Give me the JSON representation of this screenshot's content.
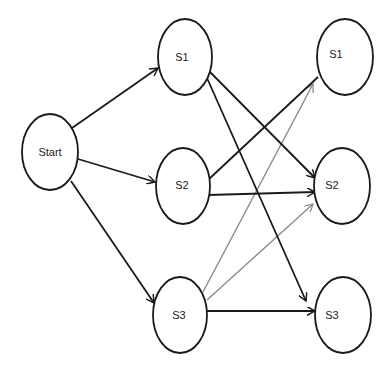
{
  "diagram": {
    "type": "state-transition-graph",
    "colors": {
      "node_stroke": "#1a1a1a",
      "edge_primary": "#1a1a1a",
      "edge_secondary": "#8a8a8a",
      "background": "#ffffff"
    },
    "nodes": [
      {
        "id": "start",
        "label": "Start",
        "cx": 50,
        "cy": 152,
        "rx": 28,
        "ry": 38
      },
      {
        "id": "s1_left",
        "label": "S1",
        "cx": 185,
        "cy": 57,
        "rx": 27,
        "ry": 38
      },
      {
        "id": "s2_left",
        "label": "S2",
        "cx": 183,
        "cy": 186,
        "rx": 27,
        "ry": 38
      },
      {
        "id": "s3_left",
        "label": "S3",
        "cx": 180,
        "cy": 315,
        "rx": 27,
        "ry": 38
      },
      {
        "id": "s1_right",
        "label": "S1",
        "cx": 345,
        "cy": 57,
        "rx": 28,
        "ry": 38
      },
      {
        "id": "s2_right",
        "label": "S2",
        "cx": 342,
        "cy": 186,
        "rx": 28,
        "ry": 38
      },
      {
        "id": "s3_right",
        "label": "S3",
        "cx": 343,
        "cy": 315,
        "rx": 28,
        "ry": 38
      }
    ],
    "edges": [
      {
        "from": "start",
        "to": "s1_left",
        "style": "black"
      },
      {
        "from": "start",
        "to": "s2_left",
        "style": "black"
      },
      {
        "from": "start",
        "to": "s3_left",
        "style": "black"
      },
      {
        "from": "s1_left",
        "to": "s2_right",
        "style": "black"
      },
      {
        "from": "s1_left",
        "to": "s3_right",
        "style": "black"
      },
      {
        "from": "s2_left",
        "to": "s1_right",
        "style": "black"
      },
      {
        "from": "s2_left",
        "to": "s2_right",
        "style": "black"
      },
      {
        "from": "s3_left",
        "to": "s3_right",
        "style": "black"
      },
      {
        "from": "s3_left",
        "to": "s1_right",
        "style": "gray"
      },
      {
        "from": "s3_left",
        "to": "s2_right",
        "style": "gray"
      }
    ]
  }
}
